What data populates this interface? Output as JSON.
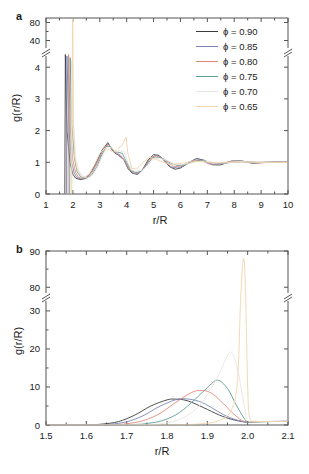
{
  "figure": {
    "background": "#ffffff",
    "panels": [
      "a",
      "b"
    ]
  },
  "panel_a": {
    "label": "a",
    "xlabel": "r/R",
    "ylabel": "g(r/R)",
    "xticks": [
      "1",
      "2",
      "3",
      "4",
      "5",
      "6",
      "7",
      "8",
      "9",
      "10"
    ],
    "yticks_lower": [
      "0",
      "1",
      "2",
      "3",
      "4"
    ],
    "yticks_upper": [
      "40",
      "80"
    ],
    "axis_break": true
  },
  "panel_b": {
    "label": "b",
    "xlabel": "r/R",
    "ylabel": "g(r/R)",
    "xticks": [
      "1.5",
      "1.6",
      "1.7",
      "1.8",
      "1.9",
      "2.0",
      "2.1"
    ],
    "yticks_lower": [
      "0",
      "10",
      "20",
      "30"
    ],
    "yticks_upper": [
      "80",
      "90"
    ],
    "axis_break": true
  },
  "legend": {
    "entries": [
      {
        "label": "ϕ = 0.90",
        "color": "#3c3c3c"
      },
      {
        "label": "ϕ = 0.85",
        "color": "#7a86b8"
      },
      {
        "label": "ϕ = 0.80",
        "color": "#e08a7a"
      },
      {
        "label": "ϕ = 0.75",
        "color": "#5f9e96"
      },
      {
        "label": "ϕ = 0.70",
        "color": "#ece4e0"
      },
      {
        "label": "ϕ = 0.65",
        "color": "#f3d4ac"
      }
    ]
  },
  "chart_data": [
    {
      "type": "line",
      "panel": "a",
      "title": "",
      "xlabel": "r/R",
      "ylabel": "g(r/R)",
      "xlim": [
        1,
        10
      ],
      "ylim_lower": [
        0,
        4.4
      ],
      "ylim_upper": [
        20,
        90
      ],
      "broken_axis": true,
      "grid": false,
      "legend_position": "upper right",
      "series": [
        {
          "name": "ϕ = 0.90",
          "color": "#3c3c3c",
          "contact_peak_x": 1.72,
          "contact_peak_y": 4.4,
          "x": [
            1.7,
            1.72,
            1.78,
            1.9,
            2.0,
            2.1,
            2.3,
            2.5,
            2.7,
            2.9,
            3.1,
            3.3,
            3.45,
            3.55,
            3.7,
            3.9,
            4.05,
            4.2,
            4.4,
            4.6,
            4.8,
            5.0,
            5.2,
            5.4,
            5.6,
            5.8,
            6.0,
            6.3,
            6.6,
            6.9,
            7.2,
            7.5,
            7.9,
            8.3,
            8.7,
            9.2,
            9.6,
            10.0
          ],
          "y": [
            0.0,
            4.4,
            2.0,
            0.95,
            0.62,
            0.5,
            0.45,
            0.52,
            0.72,
            1.05,
            1.4,
            1.62,
            1.4,
            1.3,
            1.22,
            1.08,
            0.8,
            0.66,
            0.62,
            0.78,
            1.08,
            1.24,
            1.22,
            1.05,
            0.86,
            0.78,
            0.82,
            0.98,
            1.12,
            1.06,
            0.92,
            0.92,
            1.04,
            1.04,
            0.97,
            1.0,
            1.01,
            1.0
          ]
        },
        {
          "name": "ϕ = 0.85",
          "color": "#7a86b8",
          "contact_peak_x": 1.78,
          "contact_peak_y": 4.35,
          "x": [
            1.76,
            1.78,
            1.85,
            1.95,
            2.05,
            2.15,
            2.35,
            2.55,
            2.75,
            2.95,
            3.15,
            3.32,
            3.48,
            3.6,
            3.75,
            3.92,
            4.08,
            4.25,
            4.45,
            4.65,
            4.85,
            5.05,
            5.25,
            5.45,
            5.65,
            5.9,
            6.15,
            6.45,
            6.75,
            7.05,
            7.4,
            7.8,
            8.2,
            8.6,
            9.1,
            9.6,
            10.0
          ],
          "y": [
            0.0,
            4.35,
            2.1,
            1.0,
            0.66,
            0.52,
            0.46,
            0.55,
            0.76,
            1.1,
            1.45,
            1.58,
            1.38,
            1.28,
            1.2,
            1.05,
            0.78,
            0.65,
            0.64,
            0.82,
            1.1,
            1.22,
            1.18,
            1.02,
            0.85,
            0.82,
            0.9,
            1.06,
            1.08,
            0.95,
            0.92,
            1.02,
            1.04,
            0.98,
            1.0,
            1.0,
            1.0
          ]
        },
        {
          "name": "ϕ = 0.80",
          "color": "#e08a7a",
          "contact_peak_x": 1.84,
          "contact_peak_y": 4.4,
          "x": [
            1.82,
            1.84,
            1.9,
            2.0,
            2.1,
            2.2,
            2.4,
            2.6,
            2.8,
            3.0,
            3.18,
            3.35,
            3.5,
            3.62,
            3.78,
            3.95,
            4.1,
            4.28,
            4.48,
            4.68,
            4.88,
            5.1,
            5.3,
            5.52,
            5.75,
            6.0,
            6.25,
            6.55,
            6.85,
            7.2,
            7.6,
            8.0,
            8.45,
            8.9,
            9.4,
            10.0
          ],
          "y": [
            0.0,
            4.4,
            2.15,
            1.05,
            0.68,
            0.54,
            0.46,
            0.56,
            0.8,
            1.15,
            1.5,
            1.55,
            1.36,
            1.3,
            1.22,
            1.02,
            0.76,
            0.66,
            0.68,
            0.86,
            1.12,
            1.2,
            1.14,
            1.0,
            0.86,
            0.88,
            0.96,
            1.06,
            1.04,
            0.94,
            0.96,
            1.03,
            1.02,
            0.98,
            1.0,
            1.0
          ]
        },
        {
          "name": "ϕ = 0.75",
          "color": "#5f9e96",
          "contact_peak_x": 1.9,
          "contact_peak_y": 4.3,
          "x": [
            1.88,
            1.9,
            1.96,
            2.06,
            2.16,
            2.28,
            2.48,
            2.68,
            2.88,
            3.06,
            3.24,
            3.4,
            3.54,
            3.68,
            3.84,
            4.0,
            4.15,
            4.34,
            4.54,
            4.74,
            4.96,
            5.18,
            5.4,
            5.62,
            5.88,
            6.14,
            6.42,
            6.75,
            7.1,
            7.5,
            7.95,
            8.4,
            8.9,
            9.45,
            10.0
          ],
          "y": [
            0.0,
            4.3,
            2.2,
            1.1,
            0.7,
            0.55,
            0.48,
            0.58,
            0.84,
            1.2,
            1.5,
            1.5,
            1.34,
            1.32,
            1.28,
            1.0,
            0.74,
            0.68,
            0.72,
            0.9,
            1.14,
            1.16,
            1.1,
            0.98,
            0.9,
            0.92,
            1.0,
            1.06,
            1.0,
            0.96,
            1.0,
            1.02,
            1.0,
            1.0,
            1.0
          ]
        },
        {
          "name": "ϕ = 0.70",
          "color": "#ece4e0",
          "contact_peak_x": 1.95,
          "contact_peak_y": 4.2,
          "x": [
            1.93,
            1.95,
            2.01,
            2.11,
            2.22,
            2.34,
            2.54,
            2.74,
            2.94,
            3.12,
            3.28,
            3.44,
            3.58,
            3.74,
            3.9,
            4.05,
            4.22,
            4.4,
            4.6,
            4.82,
            5.04,
            5.26,
            5.5,
            5.74,
            6.0,
            6.28,
            6.58,
            6.92,
            7.3,
            7.72,
            8.18,
            8.68,
            9.2,
            9.7,
            10.0
          ],
          "y": [
            0.0,
            4.2,
            2.25,
            1.14,
            0.74,
            0.58,
            0.5,
            0.6,
            0.88,
            1.24,
            1.48,
            1.46,
            1.34,
            1.36,
            1.34,
            0.98,
            0.74,
            0.72,
            0.76,
            0.94,
            1.14,
            1.12,
            1.06,
            0.96,
            0.92,
            0.96,
            1.02,
            1.04,
            0.98,
            0.98,
            1.02,
            1.01,
            1.0,
            1.0,
            1.0
          ]
        },
        {
          "name": "ϕ = 0.65",
          "color": "#f3d4ac",
          "contact_peak_x": 1.99,
          "contact_peak_y": 88,
          "x": [
            1.96,
            1.99,
            2.02,
            2.06,
            2.16,
            2.28,
            2.4,
            2.6,
            2.8,
            3.0,
            3.18,
            3.34,
            3.5,
            3.66,
            3.82,
            3.98,
            4.04,
            4.2,
            4.4,
            4.62,
            4.84,
            5.08,
            5.32,
            5.58,
            5.84,
            6.12,
            6.44,
            6.8,
            7.2,
            7.64,
            8.12,
            8.64,
            9.2,
            9.7,
            10.0
          ],
          "y": [
            0.0,
            88.0,
            2.4,
            1.2,
            0.78,
            0.6,
            0.52,
            0.62,
            0.92,
            1.28,
            1.44,
            1.4,
            1.32,
            1.42,
            1.52,
            1.8,
            1.3,
            0.8,
            0.82,
            1.0,
            1.16,
            1.1,
            1.02,
            0.94,
            0.94,
            0.98,
            1.04,
            1.02,
            0.98,
            1.0,
            1.02,
            1.0,
            1.0,
            1.0,
            1.0
          ]
        }
      ]
    },
    {
      "type": "line",
      "panel": "b",
      "title": "",
      "xlabel": "r/R",
      "ylabel": "g(r/R)",
      "xlim": [
        1.5,
        2.1
      ],
      "ylim_lower": [
        0,
        33
      ],
      "ylim_upper": [
        78,
        90
      ],
      "broken_axis": true,
      "grid": false,
      "series": [
        {
          "name": "ϕ = 0.90",
          "color": "#3c3c3c",
          "peak_x": 1.82,
          "peak_y": 6.8,
          "x": [
            1.5,
            1.6,
            1.64,
            1.68,
            1.72,
            1.76,
            1.8,
            1.82,
            1.85,
            1.89,
            1.93,
            1.96,
            1.99,
            2.0,
            2.02,
            2.05,
            2.1
          ],
          "y": [
            0.0,
            0.05,
            0.25,
            0.9,
            2.6,
            5.0,
            6.6,
            6.8,
            6.4,
            4.6,
            2.6,
            1.5,
            0.85,
            0.8,
            0.85,
            0.9,
            0.95
          ]
        },
        {
          "name": "ϕ = 0.85",
          "color": "#7a86b8",
          "peak_x": 1.845,
          "peak_y": 6.9,
          "x": [
            1.5,
            1.62,
            1.66,
            1.7,
            1.74,
            1.78,
            1.82,
            1.845,
            1.88,
            1.91,
            1.94,
            1.97,
            1.99,
            2.0,
            2.03,
            2.1
          ],
          "y": [
            0.0,
            0.05,
            0.22,
            0.85,
            2.4,
            4.8,
            6.6,
            6.9,
            6.2,
            4.6,
            2.7,
            1.4,
            0.85,
            0.8,
            0.88,
            0.95
          ]
        },
        {
          "name": "ϕ = 0.80",
          "color": "#e08a7a",
          "peak_x": 1.885,
          "peak_y": 9.1,
          "x": [
            1.5,
            1.66,
            1.7,
            1.74,
            1.78,
            1.82,
            1.86,
            1.885,
            1.91,
            1.94,
            1.96,
            1.98,
            1.99,
            2.0,
            2.03,
            2.1
          ],
          "y": [
            0.0,
            0.1,
            0.35,
            1.1,
            2.9,
            5.8,
            8.5,
            9.1,
            8.4,
            5.6,
            3.4,
            1.6,
            1.0,
            0.85,
            0.9,
            0.95
          ]
        },
        {
          "name": "ϕ = 0.75",
          "color": "#5f9e96",
          "peak_x": 1.925,
          "peak_y": 11.8,
          "x": [
            1.5,
            1.7,
            1.75,
            1.79,
            1.83,
            1.87,
            1.9,
            1.925,
            1.95,
            1.97,
            1.985,
            1.995,
            2.0,
            2.03,
            2.1
          ],
          "y": [
            0.0,
            0.1,
            0.4,
            1.2,
            3.2,
            6.8,
            9.8,
            11.8,
            9.6,
            5.6,
            2.8,
            1.2,
            0.85,
            0.9,
            0.95
          ]
        },
        {
          "name": "ϕ = 0.70",
          "color": "#ece4e0",
          "peak_x": 1.958,
          "peak_y": 19.2,
          "x": [
            1.5,
            1.74,
            1.79,
            1.83,
            1.87,
            1.9,
            1.93,
            1.945,
            1.958,
            1.972,
            1.985,
            1.993,
            1.999,
            2.01,
            2.04,
            2.1
          ],
          "y": [
            0.0,
            0.1,
            0.45,
            1.4,
            4.0,
            8.0,
            13.5,
            17.2,
            19.2,
            16.0,
            9.0,
            4.2,
            1.4,
            0.9,
            0.92,
            0.96
          ]
        },
        {
          "name": "ϕ = 0.65",
          "color": "#f3d4ac",
          "peak_x": 1.99,
          "peak_y": 88,
          "x": [
            1.5,
            1.8,
            1.88,
            1.93,
            1.96,
            1.975,
            1.983,
            1.99,
            1.995,
            2.0,
            2.005,
            2.02,
            2.05,
            2.1
          ],
          "y": [
            0.0,
            0.05,
            0.3,
            1.2,
            4.0,
            12.0,
            40.0,
            88.0,
            50.0,
            10.0,
            2.0,
            1.0,
            0.95,
            0.95
          ]
        }
      ]
    }
  ]
}
